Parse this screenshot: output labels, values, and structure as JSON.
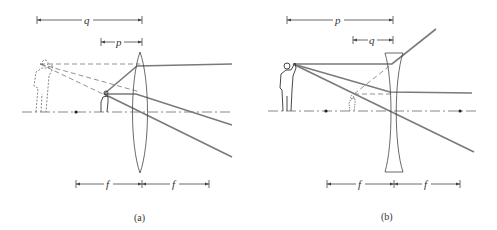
{
  "figure": {
    "panels": [
      {
        "id": "a",
        "caption": "(a)",
        "lens_type": "converging",
        "labels": {
          "image_distance": "q",
          "object_distance": "p",
          "focal_left": "f",
          "focal_right": "f"
        },
        "description": "Converging lens used as magnifier: object inside focal length produces enlarged upright virtual image"
      },
      {
        "id": "b",
        "caption": "(b)",
        "lens_type": "diverging",
        "labels": {
          "object_distance": "p",
          "image_distance": "q",
          "focal_left": "f",
          "focal_right": "f"
        },
        "description": "Diverging lens: produces reduced upright virtual image"
      }
    ],
    "colors": {
      "ray": "#7a7a7a",
      "line": "#555555",
      "background": "#ffffff"
    }
  }
}
